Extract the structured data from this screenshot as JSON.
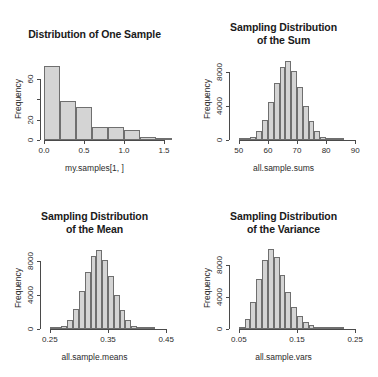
{
  "page": {
    "background": "#ffffff",
    "bar_fill": "#d4d4d4",
    "bar_border": "#6f6f6f",
    "axis_color": "#4a4a4a",
    "layout": "2x2 grid of R base-graphics histograms"
  },
  "panels": [
    {
      "id": "panel-one-sample",
      "title_lines": [
        "Distribution of One Sample"
      ],
      "ylabel": "Frequency",
      "xlabel": "my.samples[1, ]"
    },
    {
      "id": "panel-sum",
      "title_lines": [
        "Sampling Distribution",
        "of the Sum"
      ],
      "ylabel": "Frequency",
      "xlabel": "all.sample.sums"
    },
    {
      "id": "panel-mean",
      "title_lines": [
        "Sampling Distribution",
        "of the Mean"
      ],
      "ylabel": "Frequency",
      "xlabel": "all.sample.means"
    },
    {
      "id": "panel-variance",
      "title_lines": [
        "Sampling Distribution",
        "of the Variance"
      ],
      "ylabel": "Frequency",
      "xlabel": "all.sample.vars"
    }
  ],
  "chart_data": [
    {
      "type": "bar",
      "id": "distribution-of-one-sample",
      "title": "Distribution of One Sample",
      "xlabel": "my.samples[1, ]",
      "ylabel": "Frequency",
      "xlim": [
        0.0,
        1.6
      ],
      "ylim": [
        0,
        80
      ],
      "xticks": [
        0.0,
        0.5,
        1.0,
        1.5
      ],
      "xticklabels": [
        "0.0",
        "0.5",
        "1.0",
        "1.5"
      ],
      "yticks": [
        0,
        20,
        40,
        60
      ],
      "yticklabels": [
        "0",
        "20",
        "",
        "60"
      ],
      "bin_width": 0.2,
      "bin_starts": [
        0.0,
        0.2,
        0.4,
        0.6,
        0.8,
        1.0,
        1.2,
        1.4
      ],
      "values": [
        72,
        38,
        32,
        13,
        13,
        10,
        3,
        1
      ],
      "grid": false,
      "legend": false
    },
    {
      "type": "bar",
      "id": "sampling-distribution-of-the-sum",
      "title": "Sampling Distribution of the Sum",
      "xlabel": "all.sample.sums",
      "ylabel": "Frequency",
      "xlim": [
        48,
        92
      ],
      "ylim": [
        0,
        9600
      ],
      "xticks": [
        50,
        60,
        70,
        80,
        90
      ],
      "xticklabels": [
        "50",
        "60",
        "70",
        "80",
        "90"
      ],
      "yticks": [
        0,
        4000,
        8000
      ],
      "yticklabels": [
        "0",
        "4000",
        "8000"
      ],
      "bin_width": 2,
      "bin_starts": [
        50,
        52,
        54,
        56,
        58,
        60,
        62,
        64,
        66,
        68,
        70,
        72,
        74,
        76,
        78,
        80,
        82,
        84
      ],
      "values": [
        40,
        120,
        400,
        1050,
        2350,
        4450,
        6700,
        8500,
        9200,
        8100,
        6200,
        4000,
        2200,
        1000,
        400,
        120,
        40,
        10
      ],
      "grid": false,
      "legend": false
    },
    {
      "type": "bar",
      "id": "sampling-distribution-of-the-mean",
      "title": "Sampling Distribution of the Mean",
      "xlabel": "all.sample.means",
      "ylabel": "Frequency",
      "xlim": [
        0.24,
        0.46
      ],
      "ylim": [
        0,
        9600
      ],
      "xticks": [
        0.25,
        0.35,
        0.45
      ],
      "xticklabels": [
        "0.25",
        "0.35",
        "0.45"
      ],
      "yticks": [
        0,
        4000,
        8000
      ],
      "yticklabels": [
        "0",
        "4000",
        "8000"
      ],
      "bin_width": 0.01,
      "bin_starts": [
        0.25,
        0.26,
        0.27,
        0.28,
        0.29,
        0.3,
        0.31,
        0.32,
        0.33,
        0.34,
        0.35,
        0.36,
        0.37,
        0.38,
        0.39,
        0.4,
        0.41,
        0.42
      ],
      "values": [
        40,
        120,
        400,
        1050,
        2350,
        4450,
        6700,
        8500,
        9200,
        8100,
        6200,
        4000,
        2200,
        1000,
        400,
        120,
        40,
        10
      ],
      "grid": false,
      "legend": false
    },
    {
      "type": "bar",
      "id": "sampling-distribution-of-the-variance",
      "title": "Sampling Distribution of the Variance",
      "xlabel": "all.sample.vars",
      "ylabel": "Frequency",
      "xlim": [
        0.04,
        0.26
      ],
      "ylim": [
        0,
        10200
      ],
      "xticks": [
        0.05,
        0.15,
        0.25
      ],
      "xticklabels": [
        "0.05",
        "0.15",
        "0.25"
      ],
      "yticks": [
        0,
        4000,
        8000
      ],
      "yticklabels": [
        "0",
        "4000",
        "8000"
      ],
      "bin_width": 0.01,
      "bin_starts": [
        0.05,
        0.06,
        0.07,
        0.08,
        0.09,
        0.1,
        0.11,
        0.12,
        0.13,
        0.14,
        0.15,
        0.16,
        0.17,
        0.18,
        0.19,
        0.2,
        0.21,
        0.22
      ],
      "values": [
        250,
        1200,
        3350,
        6200,
        8600,
        9900,
        9000,
        6700,
        4600,
        2800,
        1600,
        850,
        450,
        200,
        90,
        40,
        15,
        5
      ],
      "grid": false,
      "legend": false
    }
  ]
}
